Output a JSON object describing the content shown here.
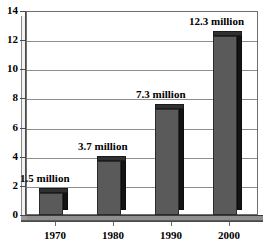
{
  "chart_data": {
    "type": "bar",
    "title": "",
    "subtitle": "",
    "xlabel": "",
    "ylabel": "",
    "categories": [
      "1970",
      "1980",
      "1990",
      "2000"
    ],
    "values": [
      1.5,
      3.7,
      7.3,
      12.3
    ],
    "data_labels": [
      "1.5 million",
      "3.7 million",
      "7.3 million",
      "12.3 million"
    ],
    "ylim": [
      0,
      14
    ],
    "ytick_labels": [
      "0",
      "2",
      "4",
      "6",
      "8",
      "10",
      "12",
      "14"
    ],
    "ytick_values": [
      0,
      2,
      4,
      6,
      8,
      10,
      12,
      14
    ],
    "grid": "horizontal",
    "legend": "none",
    "series": [
      {
        "name": "",
        "values": [
          1.5,
          3.7,
          7.3,
          12.3
        ]
      }
    ],
    "style": "3d-column",
    "colors": {
      "bar_front": "#5a5a5a",
      "bar_side": "#141414",
      "bar_top": "#303030",
      "gridline": "#8d8d8d",
      "axis": "#4a4a4a",
      "plot_background": "#ffffff",
      "floor": "#8f8f8f",
      "text": "#000000"
    }
  },
  "axes": {
    "y": {
      "ticks": [
        {
          "label": "14",
          "value": 14
        },
        {
          "label": "12",
          "value": 12
        },
        {
          "label": "10",
          "value": 10
        },
        {
          "label": "8",
          "value": 8
        },
        {
          "label": "6",
          "value": 6
        },
        {
          "label": "4",
          "value": 4
        },
        {
          "label": "2",
          "value": 2
        },
        {
          "label": "0",
          "value": 0
        }
      ]
    },
    "x": {
      "ticks": [
        {
          "label": "1970"
        },
        {
          "label": "1980"
        },
        {
          "label": "1990"
        },
        {
          "label": "2000"
        }
      ]
    }
  },
  "bars": [
    {
      "category": "1970",
      "value": 1.5,
      "label": "1.5 million"
    },
    {
      "category": "1980",
      "value": 3.7,
      "label": "3.7 million"
    },
    {
      "category": "1990",
      "value": 7.3,
      "label": "7.3 million"
    },
    {
      "category": "2000",
      "value": 12.3,
      "label": "12.3 million"
    }
  ]
}
